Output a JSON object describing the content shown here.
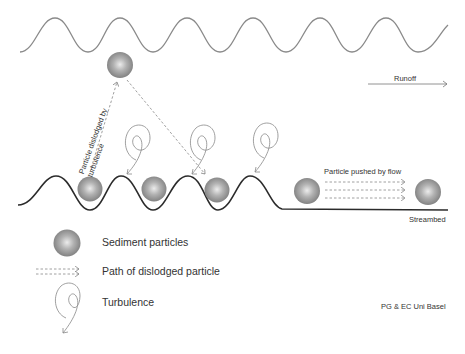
{
  "diagram": {
    "labels": {
      "runoff": "Runoff",
      "streambed": "Streambed",
      "pushed_by_flow": "Particle pushed by flow",
      "dislodged_line1": "Particle dislodged by",
      "dislodged_line2": "turbulence",
      "credit": "PG & EC Uni Basel"
    },
    "legend": [
      {
        "icon": "sediment-particle-icon",
        "label": "Sediment particles"
      },
      {
        "icon": "dashed-arrow-icon",
        "label": "Path of dislodged particle"
      },
      {
        "icon": "turbulence-spiral-icon",
        "label": "Turbulence"
      }
    ],
    "colors": {
      "water_surface": "#8a8a8a",
      "streambed": "#2b2b2b",
      "particle": "#8c8c8c",
      "particle_highlight": "#e8e8e8",
      "arrow": "#888888",
      "text": "#333333"
    }
  }
}
